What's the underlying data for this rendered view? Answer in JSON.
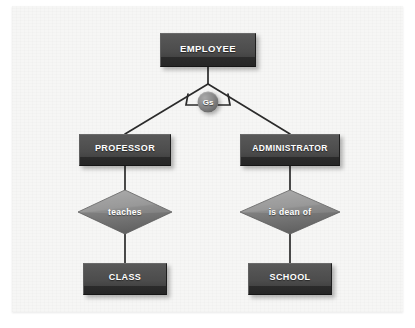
{
  "diagram": {
    "type": "er-generalization-diagram",
    "canvas": {
      "background": "#f6f6f5",
      "width": 391,
      "height": 306
    },
    "colors": {
      "entity_fill": "#4c4c4c",
      "relationship_fill": "#8c8c8c",
      "generalization_fill": "#7d7d7d",
      "label_text": "#ffffff",
      "connector_line": "#2b2b2b",
      "canvas_background": "#f6f6f5"
    },
    "entities": [
      {
        "id": "employee",
        "label": "EMPLOYEE",
        "role": "superclass",
        "x": 196,
        "y": 44,
        "w": 96,
        "h": 34,
        "font_size": 9.5
      },
      {
        "id": "professor",
        "label": "PROFESSOR",
        "role": "subclass",
        "x": 113,
        "y": 144,
        "w": 92,
        "h": 32,
        "font_size": 9
      },
      {
        "id": "administrator",
        "label": "ADMINISTRATOR",
        "role": "subclass",
        "x": 278,
        "y": 144,
        "w": 100,
        "h": 32,
        "font_size": 8.5
      },
      {
        "id": "class",
        "label": "CLASS",
        "role": "entity",
        "x": 113,
        "y": 273,
        "w": 84,
        "h": 32,
        "font_size": 9
      },
      {
        "id": "school",
        "label": "SCHOOL",
        "role": "entity",
        "x": 278,
        "y": 273,
        "w": 84,
        "h": 32,
        "font_size": 9
      }
    ],
    "relationships": [
      {
        "id": "teaches",
        "label": "teaches",
        "from": "professor",
        "to": "class",
        "x": 113,
        "y": 206,
        "w": 98,
        "h": 48,
        "font_size": 8.5
      },
      {
        "id": "is-dean-of",
        "label": "is dean of",
        "from": "administrator",
        "to": "school",
        "x": 278,
        "y": 206,
        "w": 104,
        "h": 48,
        "font_size": 8.5
      }
    ],
    "generalization": {
      "id": "gs",
      "label": "Gs",
      "symbol_meaning": "generalization-specialization",
      "parent": "employee",
      "children": [
        "professor",
        "administrator"
      ],
      "x": 196,
      "y": 96,
      "diameter": 21,
      "font_size": 8
    },
    "connectors": [
      {
        "from": "employee",
        "to": "gs",
        "kind": "vertical"
      },
      {
        "from": "gs",
        "to": "professor",
        "kind": "diagonal"
      },
      {
        "from": "gs",
        "to": "administrator",
        "kind": "diagonal"
      },
      {
        "from": "professor",
        "to": "teaches",
        "kind": "vertical"
      },
      {
        "from": "teaches",
        "to": "class",
        "kind": "vertical"
      },
      {
        "from": "administrator",
        "to": "is-dean-of",
        "kind": "vertical"
      },
      {
        "from": "is-dean-of",
        "to": "school",
        "kind": "vertical"
      }
    ]
  }
}
